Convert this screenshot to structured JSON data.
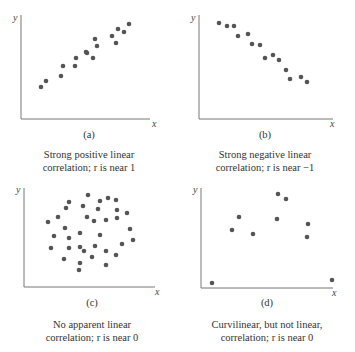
{
  "colors": {
    "dot": "#555555",
    "axis": "#777777",
    "text": "#333333"
  },
  "chart_data": [
    {
      "type": "scatter",
      "panel_label": "(a)",
      "caption_line1": "Strong positive linear",
      "caption_line2": "correlation; r is near 1",
      "xlabel": "x",
      "ylabel": "y",
      "grid": false,
      "ticks": false,
      "axis": {
        "origin": [
          21,
          119
        ],
        "x_end": 150,
        "y_top": 15
      },
      "points": [
        [
          41,
          87
        ],
        [
          46,
          81
        ],
        [
          61,
          76
        ],
        [
          63,
          66
        ],
        [
          75,
          66
        ],
        [
          76,
          58
        ],
        [
          86,
          52
        ],
        [
          87,
          53
        ],
        [
          93,
          58
        ],
        [
          95,
          39
        ],
        [
          97,
          46
        ],
        [
          112,
          36
        ],
        [
          116,
          43
        ],
        [
          118,
          29
        ],
        [
          124,
          32
        ],
        [
          129,
          24
        ]
      ]
    },
    {
      "type": "scatter",
      "panel_label": "(b)",
      "caption_line1": "Strong negative linear",
      "caption_line2": "correlation; r is near −1",
      "xlabel": "x",
      "ylabel": "y",
      "grid": false,
      "ticks": false,
      "axis": {
        "origin": [
          199,
          119
        ],
        "x_end": 333,
        "y_top": 15
      },
      "points": [
        [
          219,
          23
        ],
        [
          227,
          26
        ],
        [
          234,
          26
        ],
        [
          238,
          36
        ],
        [
          248,
          34
        ],
        [
          252,
          44
        ],
        [
          260,
          45
        ],
        [
          265,
          58
        ],
        [
          273,
          55
        ],
        [
          279,
          60
        ],
        [
          286,
          70
        ],
        [
          290,
          79
        ],
        [
          301,
          77
        ],
        [
          307,
          82
        ]
      ]
    },
    {
      "type": "scatter",
      "panel_label": "(c)",
      "caption_line1": "No apparent linear",
      "caption_line2": "correlation; r is near 0",
      "xlabel": "x",
      "ylabel": "y",
      "grid": false,
      "ticks": false,
      "axis": {
        "origin": [
          24,
          287
        ],
        "x_end": 155,
        "y_top": 188
      },
      "points": [
        [
          69,
          202
        ],
        [
          66,
          208
        ],
        [
          48,
          222
        ],
        [
          58,
          217
        ],
        [
          65,
          228
        ],
        [
          54,
          236
        ],
        [
          69,
          238
        ],
        [
          51,
          248
        ],
        [
          69,
          248
        ],
        [
          64,
          259
        ],
        [
          83,
          206
        ],
        [
          87,
          217
        ],
        [
          80,
          233
        ],
        [
          80,
          247
        ],
        [
          84,
          251
        ],
        [
          80,
          263
        ],
        [
          79,
          270
        ],
        [
          88,
          195
        ],
        [
          100,
          201
        ],
        [
          108,
          198
        ],
        [
          116,
          200
        ],
        [
          98,
          209
        ],
        [
          117,
          210
        ],
        [
          127,
          213
        ],
        [
          94,
          221
        ],
        [
          106,
          220
        ],
        [
          117,
          218
        ],
        [
          130,
          229
        ],
        [
          100,
          235
        ],
        [
          133,
          240
        ],
        [
          122,
          244
        ],
        [
          95,
          246
        ],
        [
          106,
          251
        ],
        [
          116,
          255
        ],
        [
          92,
          257
        ],
        [
          106,
          265
        ]
      ]
    },
    {
      "type": "scatter",
      "panel_label": "(d)",
      "caption_line1": "Curvilinear, but not linear,",
      "caption_line2": "correlation; r is near 0",
      "xlabel": "x",
      "ylabel": "y",
      "grid": false,
      "ticks": false,
      "axis": {
        "origin": [
          201,
          288
        ],
        "x_end": 333,
        "y_top": 188
      },
      "points": [
        [
          212,
          283
        ],
        [
          232,
          230
        ],
        [
          239,
          217
        ],
        [
          253,
          234
        ],
        [
          277,
          219
        ],
        [
          278,
          194
        ],
        [
          286,
          199
        ],
        [
          308,
          224
        ],
        [
          307,
          237
        ],
        [
          332,
          280
        ]
      ]
    }
  ]
}
